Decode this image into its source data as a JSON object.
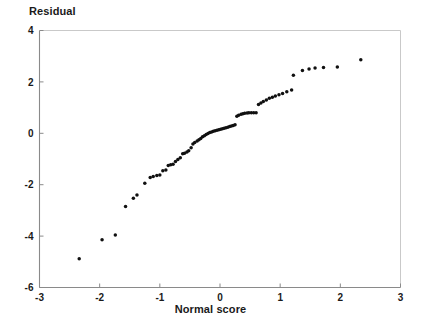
{
  "chart_data": {
    "type": "scatter",
    "title": "",
    "xlabel": "Normal score",
    "ylabel": "Residual",
    "xlim": [
      -3,
      3
    ],
    "ylim": [
      -6,
      4
    ],
    "xticks": [
      -3,
      -2,
      -1,
      0,
      1,
      2,
      3
    ],
    "xtick_labels": [
      "-3",
      "-2",
      "-1",
      "0",
      "1",
      "2",
      "3"
    ],
    "yticks": [
      -6,
      -4,
      -2,
      0,
      2,
      4
    ],
    "ytick_labels": [
      "-6",
      "-4",
      "-2",
      "0",
      "2",
      "4"
    ],
    "grid": false,
    "legend": null,
    "marker": {
      "shape": "circle",
      "color": "#101010",
      "size_px": 3
    },
    "axis_color": "#8a8a8a",
    "series": [
      {
        "name": "residuals",
        "x": [
          -2.34,
          -1.96,
          -1.74,
          -1.57,
          -1.44,
          -1.38,
          -1.25,
          -1.16,
          -1.11,
          -1.05,
          -1.0,
          -0.95,
          -0.9,
          -0.86,
          -0.82,
          -0.78,
          -0.74,
          -0.7,
          -0.66,
          -0.62,
          -0.59,
          -0.55,
          -0.52,
          -0.48,
          -0.45,
          -0.42,
          -0.38,
          -0.35,
          -0.32,
          -0.29,
          -0.26,
          -0.23,
          -0.2,
          -0.17,
          -0.14,
          -0.11,
          -0.08,
          -0.05,
          -0.02,
          0.01,
          0.04,
          0.07,
          0.1,
          0.13,
          0.16,
          0.19,
          0.22,
          0.25,
          0.28,
          0.31,
          0.35,
          0.38,
          0.41,
          0.45,
          0.48,
          0.52,
          0.56,
          0.6,
          0.64,
          0.68,
          0.72,
          0.77,
          0.82,
          0.87,
          0.92,
          0.98,
          1.04,
          1.11,
          1.19,
          1.22,
          1.37,
          1.48,
          1.58,
          1.72,
          1.95,
          2.34
        ],
        "y": [
          -4.88,
          -4.14,
          -3.96,
          -2.85,
          -2.53,
          -2.4,
          -1.94,
          -1.72,
          -1.68,
          -1.64,
          -1.62,
          -1.46,
          -1.43,
          -1.25,
          -1.22,
          -1.2,
          -1.1,
          -1.02,
          -0.95,
          -0.8,
          -0.78,
          -0.73,
          -0.68,
          -0.56,
          -0.42,
          -0.36,
          -0.3,
          -0.25,
          -0.2,
          -0.13,
          -0.1,
          -0.05,
          -0.01,
          0.03,
          0.05,
          0.08,
          0.1,
          0.12,
          0.14,
          0.16,
          0.18,
          0.2,
          0.22,
          0.24,
          0.26,
          0.28,
          0.3,
          0.33,
          0.66,
          0.7,
          0.74,
          0.76,
          0.78,
          0.79,
          0.8,
          0.8,
          0.8,
          0.8,
          1.12,
          1.18,
          1.24,
          1.3,
          1.36,
          1.4,
          1.45,
          1.5,
          1.55,
          1.62,
          1.68,
          2.26,
          2.44,
          2.5,
          2.54,
          2.56,
          2.58,
          2.86
        ]
      }
    ]
  }
}
